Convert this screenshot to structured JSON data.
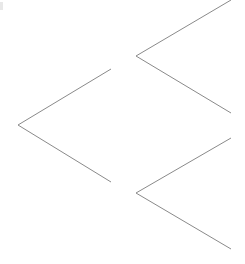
{
  "diagram": {
    "type": "tree",
    "orientation": "right-to-left-branches",
    "edge_color": "#8a8a8a",
    "background": "#ffffff",
    "branches": [
      {
        "name": "left-branch",
        "apex": [
          18,
          125
        ],
        "upper_end": [
          111,
          69
        ],
        "lower_end": [
          111,
          182
        ]
      },
      {
        "name": "top-right-branch",
        "apex": [
          136,
          56
        ],
        "upper_end": [
          231,
          0
        ],
        "lower_end": [
          231,
          113
        ]
      },
      {
        "name": "bottom-right-branch",
        "apex": [
          136,
          193
        ],
        "upper_end": [
          231,
          138
        ],
        "lower_end": [
          231,
          249
        ]
      }
    ]
  }
}
